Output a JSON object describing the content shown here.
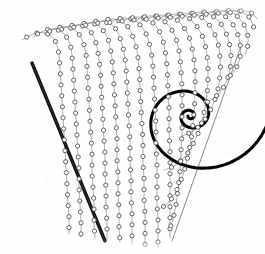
{
  "figure": {
    "caption": "",
    "background_color": "#fefefe",
    "ink_color": "#3a3a3a",
    "dark_ink_color": "#101010",
    "width": 265,
    "height": 254
  },
  "chart_data": {
    "type": "scatter",
    "subtitle": "",
    "xlabel": "",
    "ylabel": "",
    "xlim": [
      0,
      265
    ],
    "ylim": [
      0,
      254
    ],
    "grid": false,
    "legend_position": "none",
    "tick_labels_x": [],
    "tick_labels_y": [],
    "annotations": [],
    "marker": {
      "shape": "circle-open",
      "radius": 2.1,
      "stroke": "#4a4a4a",
      "fill": "#ffffff",
      "stroke_width": 0.85,
      "spacing_px": 11
    },
    "series": [
      {
        "name": "trajectory-01",
        "kind": "dotted-curve",
        "points": [
          [
            22,
            40
          ],
          [
            29,
            36
          ],
          [
            37,
            33
          ],
          [
            45,
            33
          ],
          [
            52,
            37
          ],
          [
            57,
            45
          ],
          [
            59,
            56
          ],
          [
            60,
            69
          ],
          [
            61,
            84
          ],
          [
            62,
            100
          ],
          [
            63,
            117
          ],
          [
            64,
            134
          ],
          [
            65,
            151
          ],
          [
            66,
            168
          ],
          [
            67,
            185
          ],
          [
            68,
            202
          ],
          [
            69,
            219
          ],
          [
            69,
            234
          ]
        ]
      },
      {
        "name": "trajectory-02",
        "kind": "dotted-curve",
        "points": [
          [
            33,
            37
          ],
          [
            41,
            32
          ],
          [
            50,
            29
          ],
          [
            58,
            30
          ],
          [
            65,
            35
          ],
          [
            70,
            44
          ],
          [
            72,
            56
          ],
          [
            73,
            70
          ],
          [
            74,
            86
          ],
          [
            75,
            103
          ],
          [
            76,
            120
          ],
          [
            77,
            137
          ],
          [
            78,
            154
          ],
          [
            79,
            171
          ],
          [
            79,
            188
          ],
          [
            80,
            205
          ],
          [
            81,
            222
          ],
          [
            81,
            237
          ]
        ]
      },
      {
        "name": "trajectory-03",
        "kind": "dotted-curve",
        "points": [
          [
            45,
            34
          ],
          [
            54,
            29
          ],
          [
            63,
            27
          ],
          [
            71,
            28
          ],
          [
            78,
            33
          ],
          [
            83,
            42
          ],
          [
            86,
            54
          ],
          [
            87,
            68
          ],
          [
            88,
            85
          ],
          [
            89,
            102
          ],
          [
            90,
            120
          ],
          [
            91,
            137
          ],
          [
            92,
            154
          ],
          [
            92,
            171
          ],
          [
            93,
            188
          ],
          [
            94,
            205
          ],
          [
            94,
            222
          ],
          [
            95,
            238
          ]
        ]
      },
      {
        "name": "trajectory-04",
        "kind": "dotted-curve",
        "points": [
          [
            57,
            32
          ],
          [
            66,
            27
          ],
          [
            75,
            25
          ],
          [
            83,
            26
          ],
          [
            90,
            31
          ],
          [
            95,
            40
          ],
          [
            98,
            53
          ],
          [
            100,
            68
          ],
          [
            101,
            85
          ],
          [
            102,
            103
          ],
          [
            103,
            121
          ],
          [
            104,
            139
          ],
          [
            105,
            156
          ],
          [
            105,
            173
          ],
          [
            106,
            190
          ],
          [
            106,
            207
          ],
          [
            107,
            224
          ],
          [
            107,
            240
          ]
        ]
      },
      {
        "name": "trajectory-05",
        "kind": "dotted-curve",
        "points": [
          [
            69,
            30
          ],
          [
            78,
            25
          ],
          [
            87,
            23
          ],
          [
            95,
            24
          ],
          [
            102,
            29
          ],
          [
            108,
            39
          ],
          [
            111,
            52
          ],
          [
            113,
            68
          ],
          [
            114,
            86
          ],
          [
            115,
            104
          ],
          [
            116,
            122
          ],
          [
            117,
            140
          ],
          [
            117,
            158
          ],
          [
            118,
            176
          ],
          [
            118,
            193
          ],
          [
            119,
            210
          ],
          [
            119,
            227
          ],
          [
            120,
            242
          ]
        ]
      },
      {
        "name": "trajectory-06",
        "kind": "dotted-curve",
        "points": [
          [
            81,
            28
          ],
          [
            90,
            23
          ],
          [
            99,
            21
          ],
          [
            108,
            23
          ],
          [
            115,
            28
          ],
          [
            120,
            38
          ],
          [
            124,
            52
          ],
          [
            126,
            68
          ],
          [
            127,
            86
          ],
          [
            128,
            105
          ],
          [
            129,
            124
          ],
          [
            130,
            142
          ],
          [
            130,
            160
          ],
          [
            131,
            178
          ],
          [
            131,
            196
          ],
          [
            132,
            213
          ],
          [
            132,
            230
          ],
          [
            132,
            244
          ]
        ]
      },
      {
        "name": "trajectory-07",
        "kind": "dotted-curve",
        "points": [
          [
            93,
            26
          ],
          [
            102,
            21
          ],
          [
            112,
            19
          ],
          [
            120,
            21
          ],
          [
            128,
            27
          ],
          [
            133,
            37
          ],
          [
            137,
            51
          ],
          [
            139,
            68
          ],
          [
            140,
            87
          ],
          [
            141,
            106
          ],
          [
            142,
            125
          ],
          [
            143,
            144
          ],
          [
            143,
            162
          ],
          [
            144,
            180
          ],
          [
            144,
            198
          ],
          [
            145,
            216
          ],
          [
            145,
            232
          ],
          [
            145,
            246
          ]
        ]
      },
      {
        "name": "trajectory-08",
        "kind": "dotted-curve",
        "points": [
          [
            105,
            25
          ],
          [
            115,
            20
          ],
          [
            125,
            18
          ],
          [
            134,
            20
          ],
          [
            141,
            26
          ],
          [
            147,
            36
          ],
          [
            151,
            51
          ],
          [
            153,
            68
          ],
          [
            154,
            88
          ],
          [
            155,
            108
          ],
          [
            156,
            128
          ],
          [
            156,
            147
          ],
          [
            157,
            166
          ],
          [
            157,
            185
          ],
          [
            157,
            203
          ],
          [
            158,
            220
          ],
          [
            158,
            236
          ],
          [
            158,
            248
          ]
        ]
      },
      {
        "name": "trajectory-09",
        "kind": "dotted-curve",
        "points": [
          [
            117,
            23
          ],
          [
            128,
            19
          ],
          [
            138,
            17
          ],
          [
            147,
            19
          ],
          [
            155,
            25
          ],
          [
            161,
            35
          ],
          [
            165,
            50
          ],
          [
            167,
            68
          ],
          [
            168,
            89
          ],
          [
            169,
            110
          ],
          [
            169,
            130
          ],
          [
            170,
            150
          ],
          [
            170,
            169
          ],
          [
            170,
            188
          ],
          [
            170,
            206
          ],
          [
            170,
            223
          ],
          [
            170,
            238
          ]
        ]
      },
      {
        "name": "trajectory-10",
        "kind": "dotted-curve",
        "points": [
          [
            129,
            22
          ],
          [
            140,
            18
          ],
          [
            151,
            16
          ],
          [
            160,
            18
          ],
          [
            168,
            25
          ],
          [
            175,
            36
          ],
          [
            179,
            51
          ],
          [
            181,
            70
          ],
          [
            182,
            91
          ],
          [
            182,
            112
          ],
          [
            182,
            132
          ],
          [
            181,
            152
          ],
          [
            180,
            171
          ],
          [
            178,
            189
          ],
          [
            176,
            205
          ],
          [
            173,
            219
          ],
          [
            169,
            231
          ]
        ]
      },
      {
        "name": "trajectory-11",
        "kind": "dotted-curve",
        "points": [
          [
            141,
            21
          ],
          [
            153,
            17
          ],
          [
            164,
            15
          ],
          [
            174,
            18
          ],
          [
            182,
            25
          ],
          [
            189,
            37
          ],
          [
            193,
            53
          ],
          [
            195,
            72
          ],
          [
            195,
            93
          ],
          [
            194,
            113
          ],
          [
            192,
            133
          ],
          [
            189,
            151
          ],
          [
            185,
            168
          ],
          [
            180,
            183
          ],
          [
            174,
            195
          ],
          [
            167,
            204
          ],
          [
            159,
            209
          ]
        ]
      },
      {
        "name": "trajectory-12",
        "kind": "dotted-curve",
        "points": [
          [
            153,
            20
          ],
          [
            165,
            16
          ],
          [
            177,
            14
          ],
          [
            187,
            17
          ],
          [
            196,
            25
          ],
          [
            203,
            38
          ],
          [
            207,
            55
          ],
          [
            208,
            74
          ],
          [
            207,
            94
          ],
          [
            204,
            113
          ],
          [
            199,
            131
          ],
          [
            192,
            146
          ],
          [
            184,
            158
          ],
          [
            174,
            166
          ],
          [
            164,
            170
          ]
        ]
      },
      {
        "name": "trajectory-13",
        "kind": "dotted-curve",
        "points": [
          [
            165,
            19
          ],
          [
            178,
            15
          ],
          [
            190,
            13
          ],
          [
            201,
            17
          ],
          [
            210,
            26
          ],
          [
            217,
            40
          ],
          [
            220,
            57
          ],
          [
            220,
            75
          ],
          [
            217,
            93
          ],
          [
            211,
            109
          ],
          [
            203,
            122
          ],
          [
            193,
            131
          ],
          [
            182,
            136
          ]
        ]
      },
      {
        "name": "trajectory-14",
        "kind": "dotted-curve",
        "points": [
          [
            177,
            18
          ],
          [
            190,
            14
          ],
          [
            203,
            12
          ],
          [
            214,
            17
          ],
          [
            223,
            27
          ],
          [
            229,
            42
          ],
          [
            231,
            58
          ],
          [
            229,
            74
          ],
          [
            223,
            88
          ],
          [
            214,
            98
          ],
          [
            204,
            104
          ]
        ]
      },
      {
        "name": "trajectory-15",
        "kind": "dotted-curve",
        "points": [
          [
            189,
            17
          ],
          [
            202,
            13
          ],
          [
            215,
            12
          ],
          [
            226,
            17
          ],
          [
            235,
            28
          ],
          [
            240,
            43
          ],
          [
            240,
            58
          ],
          [
            235,
            70
          ],
          [
            227,
            79
          ]
        ]
      },
      {
        "name": "trajectory-16",
        "kind": "dotted-curve",
        "points": [
          [
            201,
            16
          ],
          [
            214,
            12
          ],
          [
            227,
            11
          ],
          [
            238,
            17
          ],
          [
            246,
            29
          ],
          [
            248,
            43
          ],
          [
            245,
            55
          ]
        ]
      },
      {
        "name": "trajectory-17",
        "kind": "dotted-curve",
        "points": [
          [
            213,
            15
          ],
          [
            226,
            11
          ],
          [
            239,
            11
          ],
          [
            249,
            17
          ],
          [
            254,
            28
          ]
        ]
      },
      {
        "name": "trajectory-18",
        "kind": "dotted-curve",
        "points": [
          [
            225,
            14
          ],
          [
            238,
            11
          ],
          [
            250,
            12
          ],
          [
            257,
            19
          ]
        ]
      },
      {
        "name": "separatrix-left",
        "kind": "solid-heavy-line",
        "points": [
          [
            32,
            63
          ],
          [
            105,
            241
          ]
        ]
      },
      {
        "name": "separatrix-right",
        "kind": "thin-line",
        "points": [
          [
            241,
            46
          ],
          [
            172,
            241
          ]
        ]
      },
      {
        "name": "spiral-focus",
        "kind": "solid-heavy-spiral",
        "center": [
          190,
          116
        ],
        "turns": 2.55,
        "r_start": 86,
        "r_end": 2,
        "theta_start": -0.32,
        "direction": "clockwise"
      }
    ]
  }
}
